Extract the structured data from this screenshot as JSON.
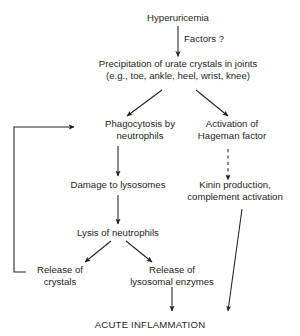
{
  "diagram": {
    "title_text": "Hyperuricemia",
    "nodes": [
      {
        "id": "hyperuricemia",
        "line1": "Hyperuricemia",
        "line2": ""
      },
      {
        "id": "precipitation",
        "line1": "Precipitation of urate crystals in joints",
        "line2": "(e.g., toe, ankle, heel, wrist, knee)"
      },
      {
        "id": "phagocytosis",
        "line1": "Phagocytosis by",
        "line2": "neutrophils"
      },
      {
        "id": "hageman",
        "line1": "Activation of",
        "line2": "Hageman factor"
      },
      {
        "id": "lysosome-damage",
        "line1": "Damage to lysosomes",
        "line2": ""
      },
      {
        "id": "kinin",
        "line1": "Kinin production,",
        "line2": "complement activation"
      },
      {
        "id": "lysis",
        "line1": "Lysis of neutrophils",
        "line2": ""
      },
      {
        "id": "release-crystals",
        "line1": "Release of",
        "line2": "crystals"
      },
      {
        "id": "release-enzymes",
        "line1": "Release of",
        "line2": "lysosomal enzymes"
      }
    ],
    "edge_labels": [
      {
        "id": "factors",
        "text": "Factors ?"
      }
    ],
    "terminal": {
      "text": "ACUTE INFLAMMATION"
    },
    "colors": {
      "ink": "#231f20",
      "background": "#ffffff"
    }
  }
}
